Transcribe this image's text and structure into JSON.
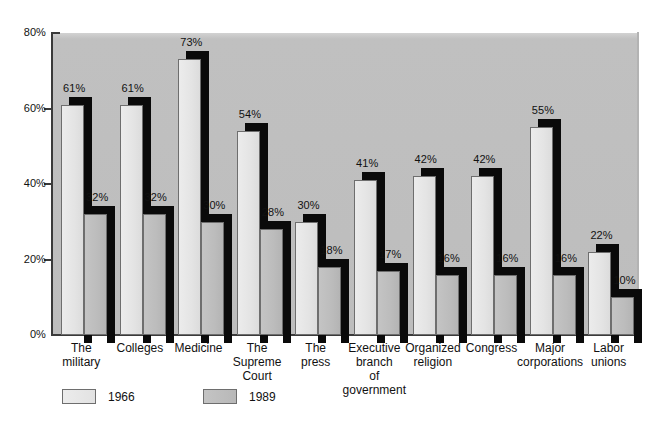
{
  "chart_data": {
    "type": "bar",
    "title": "",
    "subtitle": "",
    "xlabel": "",
    "ylabel": "",
    "ylim": [
      0,
      80
    ],
    "yticks": [
      0,
      20,
      40,
      60,
      80
    ],
    "ytick_labels": [
      "0%",
      "20%",
      "40%",
      "60%",
      "80%"
    ],
    "grid": false,
    "legend_position": "bottom",
    "categories": [
      "The military",
      "Colleges",
      "Medicine",
      "The Supreme Court",
      "The press",
      "Executive branch of government",
      "Organized religion",
      "Congress",
      "Major corporations",
      "Labor unions"
    ],
    "category_lines": [
      [
        "The",
        "military"
      ],
      [
        "Colleges"
      ],
      [
        "Medicine"
      ],
      [
        "The",
        "Supreme",
        "Court"
      ],
      [
        "The",
        "press"
      ],
      [
        "Executive",
        "branch",
        "of",
        "government"
      ],
      [
        "Organized",
        "religion"
      ],
      [
        "Congress"
      ],
      [
        "Major",
        "corporations"
      ],
      [
        "Labor",
        "unions"
      ]
    ],
    "series": [
      {
        "name": "1966",
        "color": "#e6e6e6",
        "values": [
          61,
          61,
          73,
          54,
          30,
          41,
          42,
          42,
          55,
          22
        ],
        "value_labels": [
          "61%",
          "61%",
          "73%",
          "54%",
          "30%",
          "41%",
          "42%",
          "42%",
          "55%",
          "22%"
        ]
      },
      {
        "name": "1989",
        "color": "#bdbdbd",
        "values": [
          32,
          32,
          30,
          28,
          18,
          17,
          16,
          16,
          16,
          10
        ],
        "value_labels": [
          "32%",
          "32%",
          "30%",
          "28%",
          "18%",
          "17%",
          "16%",
          "16%",
          "16%",
          "10%"
        ]
      }
    ]
  },
  "legend": {
    "items": [
      {
        "label": "1966",
        "swatch": "light-swatch"
      },
      {
        "label": "1989",
        "swatch": "dark-swatch"
      }
    ]
  },
  "colors": {
    "page_background": "#ffffff",
    "plot_background": "#bdbdbd",
    "series_1966": "#e6e6e6",
    "series_1989": "#bdbdbd",
    "shadow": "#0a0a0a",
    "axis": "#3a3a3a",
    "text": "#111111"
  }
}
